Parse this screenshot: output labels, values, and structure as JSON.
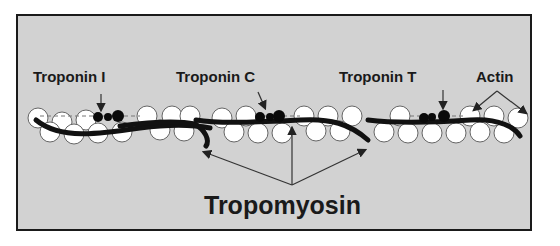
{
  "figure": {
    "labels": {
      "troponin_i": "Troponin I",
      "troponin_c": "Troponin C",
      "troponin_t": "Troponin T",
      "actin": "Actin",
      "tropomyosin": "Tropomyosin"
    },
    "colors": {
      "background": "#d2d2d2",
      "frame_border": "#1a1a1a",
      "actin_fill": "#ffffff",
      "actin_stroke": "#555555",
      "tropomyosin": "#111111",
      "troponin": "#0a0a0a",
      "text": "#1a1a1a"
    }
  }
}
